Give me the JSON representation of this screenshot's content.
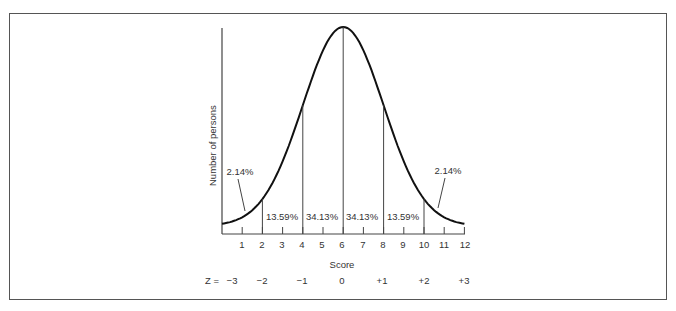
{
  "chart_data": {
    "type": "line",
    "title": "",
    "xlabel": "Score",
    "ylabel": "Number of persons",
    "x_ticks": [
      1,
      2,
      3,
      4,
      5,
      6,
      7,
      8,
      9,
      10,
      11,
      12
    ],
    "xlim": [
      0,
      12
    ],
    "mean": 6,
    "sd": 2,
    "curve": "normal distribution",
    "region_boundaries": [
      2,
      4,
      6,
      8,
      10
    ],
    "regions": [
      {
        "from": 0,
        "to": 2,
        "label": "2.14%",
        "value": 2.14
      },
      {
        "from": 2,
        "to": 4,
        "label": "13.59%",
        "value": 13.59
      },
      {
        "from": 4,
        "to": 6,
        "label": "34.13%",
        "value": 34.13
      },
      {
        "from": 6,
        "to": 8,
        "label": "34.13%",
        "value": 34.13
      },
      {
        "from": 8,
        "to": 10,
        "label": "13.59%",
        "value": 13.59
      },
      {
        "from": 10,
        "to": 12,
        "label": "2.14%",
        "value": 2.14
      }
    ],
    "z_scale": {
      "prefix": "Z = ",
      "labels": [
        "−3",
        "−2",
        "−1",
        "0",
        "+1",
        "+2",
        "+3"
      ],
      "positions": [
        0,
        2,
        4,
        6,
        8,
        10,
        12
      ]
    },
    "grid": false,
    "legend": null
  },
  "labels": {
    "ylabel": "Number of persons",
    "xlabel": "Score",
    "z_prefix": "Z = ",
    "pct_left_tail": "2.14%",
    "pct_13_left": "13.59%",
    "pct_34_left": "34.13%",
    "pct_34_right": "34.13%",
    "pct_13_right": "13.59%",
    "pct_right_tail": "2.14%",
    "ticks": [
      "1",
      "2",
      "3",
      "4",
      "5",
      "6",
      "7",
      "8",
      "9",
      "10",
      "11",
      "12"
    ],
    "z": [
      "−3",
      "−2",
      "−1",
      "0",
      "+1",
      "+2",
      "+3"
    ]
  }
}
